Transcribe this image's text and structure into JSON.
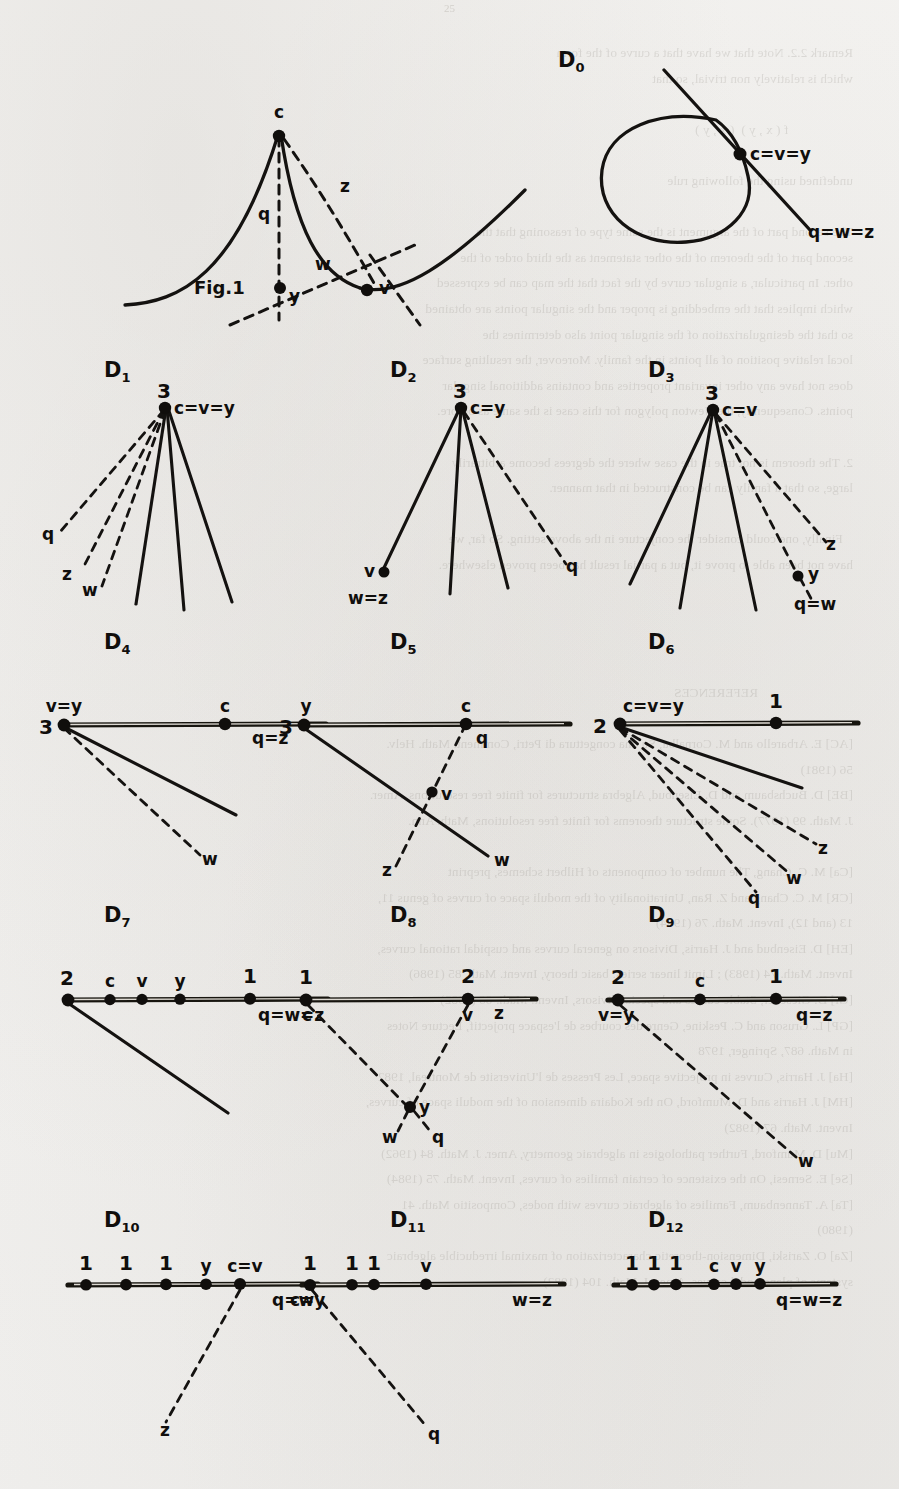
{
  "page": {
    "page_number": "25",
    "background_color": "#f3f2f0",
    "ink_color": "#141210",
    "bleed_through_text": "Remark 2.2. Note that we have that a curve of the form\nwhich is relatively non trivial, so that\n\n                   f ( x , y )  ( x , y )\n\nundefined using the following rule\n\nThe second part of the argument is the same type of reasoning that the\nsecond part of the theorem of the other statement as the third order of the\nother. In particular, a singular curve by the fact that the map can be expressed\nwhich implies that the embedding is proper and the singular points are obtained\nso that the desingularization of the singular point also determines the\nlocal relative position of all points in the family. Moreover, the resulting surface\ndoes not have any other invariant properties and contains additional singular\npoints. Consequently, the Newton polygon for this case is the same as before.\n\n2. The theorem is not true in the case where the degrees become arbitrarily\nlarge, so that a family can be constructed in that manner.\n\n   Finally, one could consider the conjecture in the above setting. So far, we\nhave not been able to prove it, but a partial result has been proved elsewhere.\n\n\n\n\n                            REFERENCES\n\n[AC] E. Arbarello and M. Cornalba, Su una congettura di Petri, Comment. Math. Helv.\n56 (1981)\n[BE] D. Buchsbaum and D. Eisenbud, Algebra structures for finite free resolutions, Amer.\nJ. Math. 99 (1977). Some structure theorems for finite free resolutions, Math. Ann.\n\n[Ca] M. C. Chang, The number of components of Hilbert schemes, preprint\n[CR] M. C. Chang and Z. Ran, Unirationality of the moduli space of curves of genus 11,\n13 (and 12), Invent. Math. 76 (1984)\n[EH] D. Eisenbud and J. Harris, Divisors on general curves and cuspidal rational curves,\nInvent. Math. 74 (1983) ; Limit linear series: basic theory, Invent. Math. 85 (1986)\n[Gi] D. Gieseker, Stable curves and special divisors, Invent. Math. 66 (1982)\n[GP] L. Gruson and C. Peskine, Genre des courbes de l'espace projectif, Lecture Notes\nin Math. 687, Springer, 1978\n[Ha] J. Harris, Curves in projective space, Les Presses de l'Universite de Montreal, 1982\n[HM] J. Harris and D. Mumford, On the Kodaira dimension of the moduli space of curves,\nInvent. Math. 67 (1982)\n[Mu] D. Mumford, Further pathologies in algebraic geometry, Amer. J. Math. 84 (1962)\n[Se] E. Sernesi, On the existence of certain families of curves, Invent. Math. 75 (1984)\n[Ta] A. Tannenbaum, Families of algebraic curves with nodes, Compositio Math. 41\n(1980)\n[Za] O. Zariski, Dimension-theoretic characterization of maximal irreducible algebraic\nsystems of plane nodal curves, Amer. J. Math. 104 (1982)",
    "figures": [
      {
        "id": "fig1",
        "caption": "Fig.1",
        "label": null,
        "kind": "cusp-curve",
        "point_labels": [
          "c",
          "v",
          "y"
        ],
        "branch_labels": [
          "q",
          "z",
          "w"
        ],
        "nodes": [
          "c",
          "v",
          "y"
        ]
      },
      {
        "id": "D0",
        "label": "D",
        "sub": "0",
        "kind": "nodal-loop",
        "point_labels": [
          "c=v=y"
        ],
        "branch_labels": [
          "q=w=z"
        ],
        "multiplicities": []
      },
      {
        "id": "D1",
        "label": "D",
        "sub": "1",
        "kind": "fan",
        "point_labels": [
          "c=v=y"
        ],
        "branch_labels": [
          "q",
          "z",
          "w"
        ],
        "multiplicities": [
          "3"
        ]
      },
      {
        "id": "D2",
        "label": "D",
        "sub": "2",
        "kind": "fan",
        "point_labels": [
          "c=y",
          "v"
        ],
        "branch_labels": [
          "q",
          "w=z"
        ],
        "multiplicities": [
          "3"
        ]
      },
      {
        "id": "D3",
        "label": "D",
        "sub": "3",
        "kind": "fan",
        "point_labels": [
          "c=v",
          "y"
        ],
        "branch_labels": [
          "z",
          "q=w"
        ],
        "multiplicities": [
          "3"
        ]
      },
      {
        "id": "D4",
        "label": "D",
        "sub": "4",
        "kind": "line-fan",
        "point_labels": [
          "v=y",
          "c"
        ],
        "branch_labels": [
          "q=z",
          "w"
        ],
        "multiplicities": [
          "3"
        ]
      },
      {
        "id": "D5",
        "label": "D",
        "sub": "5",
        "kind": "line-fan",
        "point_labels": [
          "y",
          "c",
          "v"
        ],
        "branch_labels": [
          "q=z",
          "q",
          "z",
          "w"
        ],
        "multiplicities": [
          "3"
        ]
      },
      {
        "id": "D6",
        "label": "D",
        "sub": "6",
        "kind": "line-fan",
        "point_labels": [
          "c=v=y"
        ],
        "branch_labels": [
          "z",
          "w",
          "q"
        ],
        "multiplicities": [
          "2",
          "1"
        ]
      },
      {
        "id": "D7",
        "label": "D",
        "sub": "7",
        "kind": "line-points",
        "point_labels": [
          "c",
          "v",
          "y"
        ],
        "branch_labels": [
          "q=w=z"
        ],
        "multiplicities": [
          "2",
          "1"
        ]
      },
      {
        "id": "D8",
        "label": "D",
        "sub": "8",
        "kind": "line-points",
        "point_labels": [
          "c",
          "v",
          "y"
        ],
        "branch_labels": [
          "z",
          "w",
          "q"
        ],
        "multiplicities": [
          "1",
          "2"
        ]
      },
      {
        "id": "D9",
        "label": "D",
        "sub": "9",
        "kind": "line-points",
        "point_labels": [
          "v=y",
          "c"
        ],
        "branch_labels": [
          "q=z",
          "w"
        ],
        "multiplicities": [
          "2",
          "1"
        ]
      },
      {
        "id": "D10",
        "label": "D",
        "sub": "10",
        "kind": "line-points",
        "point_labels": [
          "y",
          "c=v"
        ],
        "branch_labels": [
          "q=w",
          "z"
        ],
        "multiplicities": [
          "1",
          "1",
          "1"
        ]
      },
      {
        "id": "D11",
        "label": "D",
        "sub": "11",
        "kind": "line-points",
        "point_labels": [
          "c=y",
          "v"
        ],
        "branch_labels": [
          "w=z",
          "q"
        ],
        "multiplicities": [
          "1",
          "1",
          "1"
        ]
      },
      {
        "id": "D12",
        "label": "D",
        "sub": "12",
        "kind": "line-points",
        "point_labels": [
          "c",
          "v",
          "y"
        ],
        "branch_labels": [
          "q=w=z"
        ],
        "multiplicities": [
          "1",
          "1",
          "1"
        ]
      }
    ]
  }
}
